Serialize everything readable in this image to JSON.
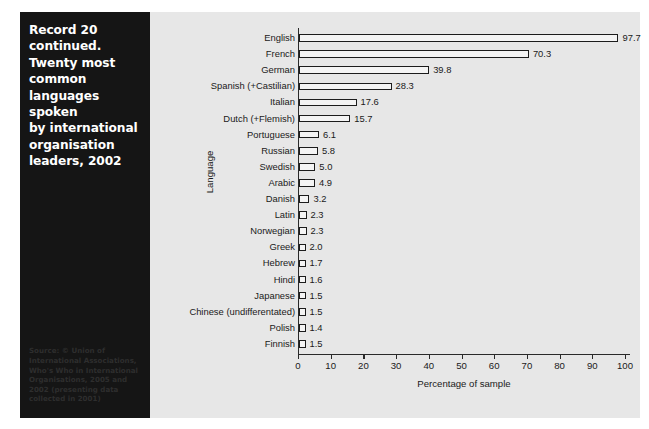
{
  "caption": {
    "title": "Record 20\ncontinued.\nTwenty most\ncommon\nlanguages spoken\nby international\norganisation\nleaders, 2002",
    "source": "Source: © Union of International Associations, Who's Who in International Organisations, 2005 and 2002 (presenting data collected in 2001)"
  },
  "colors": {
    "panel_background": "#151515",
    "chart_background": "#e7e7e7",
    "bar_fill": "#f4f4f4",
    "bar_outline": "#1c1c1c",
    "axis": "#2a2a2a",
    "text": "#1a1a1a",
    "caption_text": "#ffffff",
    "source_text": "#2e2e2e"
  },
  "chart_data": {
    "type": "bar",
    "orientation": "horizontal",
    "title": "",
    "xlabel": "Percentage of sample",
    "ylabel": "Language",
    "xlim": [
      0,
      100
    ],
    "xticks": [
      0,
      10,
      20,
      30,
      40,
      50,
      60,
      70,
      80,
      90,
      100
    ],
    "grid": false,
    "legend": false,
    "categories": [
      "English",
      "French",
      "German",
      "Spanish (+Castilian)",
      "Italian",
      "Dutch (+Flemish)",
      "Portuguese",
      "Russian",
      "Swedish",
      "Arabic",
      "Danish",
      "Latin",
      "Norwegian",
      "Greek",
      "Hebrew",
      "Hindi",
      "Japanese",
      "Chinese (undifferentated)",
      "Polish",
      "Finnish"
    ],
    "values": [
      97.7,
      70.3,
      39.8,
      28.3,
      17.6,
      15.7,
      6.1,
      5.8,
      5.0,
      4.9,
      3.2,
      2.3,
      2.3,
      2.0,
      1.7,
      1.6,
      1.5,
      1.5,
      1.4,
      1.5
    ],
    "value_labels": [
      "97.7",
      "70.3",
      "39.8",
      "28.3",
      "17.6",
      "15.7",
      "6.1",
      "5.8",
      "5.0",
      "4.9",
      "3.2",
      "2.3",
      "2.3",
      "2.0",
      "1.7",
      "1.6",
      "1.5",
      "1.5",
      "1.4",
      "1.5"
    ]
  }
}
